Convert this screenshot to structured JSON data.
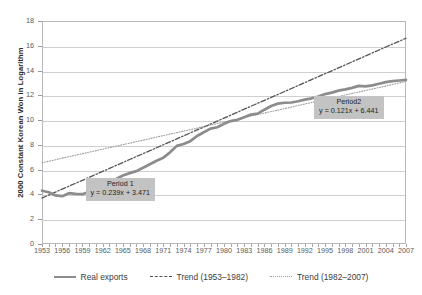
{
  "chart_data": {
    "type": "line",
    "title": "",
    "xlabel": "",
    "ylabel": "2000 Constant Korean Won in Logarithm",
    "xlim": [
      1953,
      2007
    ],
    "ylim": [
      0,
      18
    ],
    "yticks": [
      0,
      2,
      4,
      6,
      8,
      10,
      12,
      14,
      16,
      18
    ],
    "xticks": [
      1953,
      1956,
      1959,
      1962,
      1965,
      1968,
      1971,
      1974,
      1977,
      1980,
      1983,
      1986,
      1989,
      1992,
      1995,
      1998,
      2001,
      2004,
      2007
    ],
    "grid": "horizontal",
    "legend_position": "bottom",
    "x": [
      1953,
      1954,
      1955,
      1956,
      1957,
      1958,
      1959,
      1960,
      1961,
      1962,
      1963,
      1964,
      1965,
      1966,
      1967,
      1968,
      1969,
      1970,
      1971,
      1972,
      1973,
      1974,
      1975,
      1976,
      1977,
      1978,
      1979,
      1980,
      1981,
      1982,
      1983,
      1984,
      1985,
      1986,
      1987,
      1988,
      1989,
      1990,
      1991,
      1992,
      1993,
      1994,
      1995,
      1996,
      1997,
      1998,
      1999,
      2000,
      2001,
      2002,
      2003,
      2004,
      2005,
      2006,
      2007
    ],
    "series": [
      {
        "name": "Real exports",
        "style": "solid-thick",
        "color": "#8c8c8c",
        "values": [
          4.3,
          4.18,
          3.92,
          3.86,
          4.1,
          4.05,
          4.02,
          4.22,
          4.34,
          4.62,
          5.0,
          5.25,
          5.53,
          5.72,
          5.88,
          6.16,
          6.44,
          6.72,
          6.97,
          7.4,
          7.92,
          8.07,
          8.3,
          8.72,
          9.02,
          9.31,
          9.42,
          9.7,
          9.92,
          10.02,
          10.23,
          10.45,
          10.52,
          10.84,
          11.14,
          11.33,
          11.4,
          11.42,
          11.52,
          11.65,
          11.76,
          11.9,
          12.1,
          12.22,
          12.38,
          12.48,
          12.6,
          12.76,
          12.72,
          12.8,
          12.93,
          13.07,
          13.14,
          13.2,
          13.25
        ]
      },
      {
        "name": "Trend (1953–1982)",
        "style": "dash-dot",
        "color": "#555555",
        "equation": "y = 0.239x + 3.471",
        "slope": 0.239,
        "intercept": 3.471,
        "values": [
          3.71,
          3.95,
          4.19,
          4.43,
          4.67,
          4.9,
          5.14,
          5.38,
          5.62,
          5.86,
          6.1,
          6.34,
          6.58,
          6.82,
          7.06,
          7.29,
          7.53,
          7.77,
          8.01,
          8.25,
          8.49,
          8.73,
          8.97,
          9.21,
          9.44,
          9.68,
          9.92,
          10.16,
          10.4,
          10.64,
          10.88,
          11.12,
          11.36,
          11.6,
          11.83,
          12.07,
          12.31,
          12.55,
          12.79,
          13.03,
          13.27,
          13.51,
          13.75,
          13.98,
          14.22,
          14.46,
          14.7,
          14.94,
          15.18,
          15.42,
          15.66,
          15.9,
          16.14,
          16.37,
          16.61
        ]
      },
      {
        "name": "Trend (1982–2007)",
        "style": "dotted",
        "color": "#9d9d9d",
        "equation": "y = 0.121x + 6.441",
        "slope": 0.121,
        "intercept": 6.441,
        "values": [
          6.56,
          6.68,
          6.8,
          6.93,
          7.05,
          7.17,
          7.29,
          7.41,
          7.53,
          7.65,
          7.78,
          7.9,
          8.02,
          8.14,
          8.26,
          8.38,
          8.5,
          8.63,
          8.75,
          8.87,
          8.99,
          9.11,
          9.23,
          9.35,
          9.48,
          9.6,
          9.72,
          9.84,
          9.96,
          10.08,
          10.2,
          10.33,
          10.45,
          10.57,
          10.69,
          10.81,
          10.93,
          11.05,
          11.18,
          11.3,
          11.42,
          11.54,
          11.66,
          11.78,
          11.9,
          12.03,
          12.15,
          12.27,
          12.39,
          12.51,
          12.63,
          12.75,
          12.88,
          13.0,
          13.12
        ]
      }
    ],
    "annotations": [
      {
        "id": "period1",
        "title": "Period 1",
        "equation": "y = 0.239x + 3.471",
        "x": 1964.5,
        "y": 4.6
      },
      {
        "id": "period2",
        "title": "Period2",
        "equation": "y = 0.121x + 6.441",
        "x": 1999.0,
        "y": 11.2
      }
    ],
    "legend": [
      {
        "label": "Real exports",
        "style": "solid-thick"
      },
      {
        "label": "Trend (1953–1982)",
        "style": "dash-dot"
      },
      {
        "label": "Trend (1982–2007)",
        "style": "dotted"
      }
    ]
  }
}
